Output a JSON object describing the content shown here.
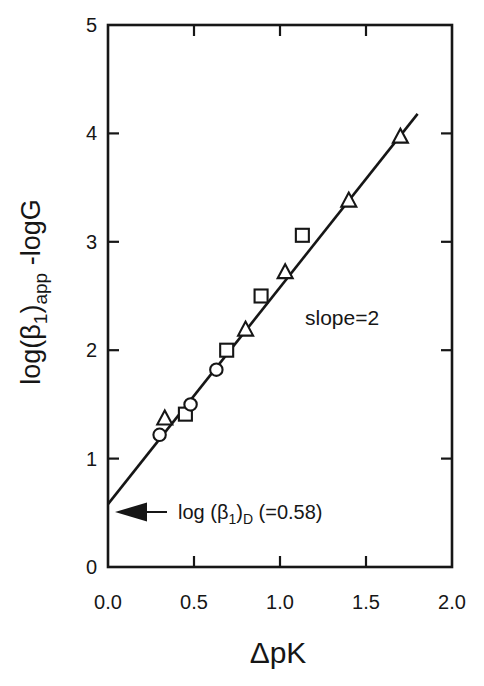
{
  "figure": {
    "background_color": "#ffffff",
    "ink_color": "#161616"
  },
  "chart_data": {
    "type": "scatter",
    "title": "",
    "xlabel": "ΔpK",
    "ylabel": "log(β1)app -logG",
    "ylabel_parts": {
      "p1": "log(β",
      "sub1": "1",
      "p2": ")",
      "sub2": "app",
      "p3": " -logG"
    },
    "xlim": [
      0,
      2
    ],
    "ylim": [
      0,
      5
    ],
    "grid": false,
    "legend": "none",
    "x_ticks": [
      0,
      0.5,
      1,
      1.5,
      2
    ],
    "x_tick_labels": [
      "0.0",
      "0.5",
      "1.0",
      "1.5",
      "2.0"
    ],
    "x_inner_ticks": [
      0.5,
      1.0,
      1.5
    ],
    "y_ticks": [
      0,
      1,
      2,
      3,
      4,
      5
    ],
    "y_tick_labels": [
      "0",
      "1",
      "2",
      "3",
      "4",
      "5"
    ],
    "y_inner_ticks": [
      1,
      2,
      3,
      4
    ],
    "series": [
      {
        "name": "triangle-series",
        "marker": "triangle",
        "points": [
          [
            0.33,
            1.37
          ],
          [
            0.8,
            2.19
          ],
          [
            1.03,
            2.72
          ],
          [
            1.4,
            3.38
          ],
          [
            1.7,
            3.97
          ]
        ]
      },
      {
        "name": "square-series",
        "marker": "square",
        "points": [
          [
            0.45,
            1.41
          ],
          [
            0.69,
            2.0
          ],
          [
            0.89,
            2.5
          ],
          [
            1.13,
            3.06
          ]
        ]
      },
      {
        "name": "circle-series",
        "marker": "circle",
        "points": [
          [
            0.3,
            1.22
          ],
          [
            0.48,
            1.5
          ],
          [
            0.63,
            1.82
          ]
        ]
      }
    ],
    "fit_line": {
      "slope": 2,
      "intercept": 0.58,
      "x_start": 0.0,
      "x_end": 1.8
    },
    "annotations": {
      "slope_text": "slope=2",
      "intercept_label": {
        "p1": "log (β",
        "sub1": "1",
        "p2": ")",
        "sub2": "D",
        "p3": " (=0.58)"
      },
      "intercept_value": 0.58
    }
  }
}
